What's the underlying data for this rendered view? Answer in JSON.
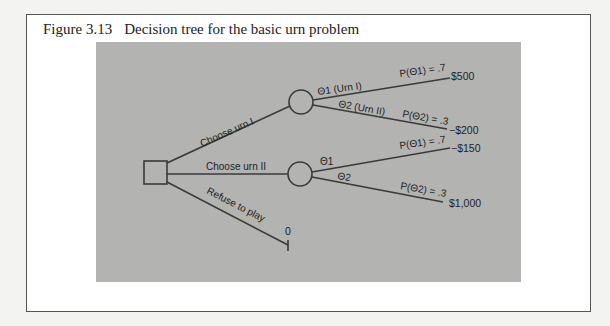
{
  "caption": {
    "figure_number": "Figure 3.13",
    "title": "Decision tree for the basic urn problem"
  },
  "tree": {
    "decision_node": {
      "shape": "square"
    },
    "branches": [
      {
        "label": "Choose urn I",
        "chance_node": {
          "outcomes": [
            {
              "state": "Θ1 (Urn I)",
              "probability": "P(Θ1) = .7",
              "payoff": "$500"
            },
            {
              "state": "Θ2 (Urn II)",
              "probability": "P(Θ2) = .3",
              "payoff": "−$200"
            }
          ]
        }
      },
      {
        "label": "Choose urn II",
        "chance_node": {
          "outcomes": [
            {
              "state": "Θ1",
              "probability": "P(Θ1) = .7",
              "payoff": "−$150"
            },
            {
              "state": "Θ2",
              "probability": "P(Θ2) = .3",
              "payoff": "$1,000"
            }
          ]
        }
      },
      {
        "label": "Refuse to play",
        "payoff": "0"
      }
    ]
  },
  "colors": {
    "panel": "#b3b3b2",
    "line": "#3a3a3a",
    "frame_bg": "#ffffff"
  }
}
